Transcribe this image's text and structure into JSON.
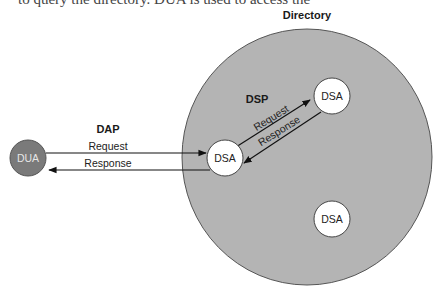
{
  "intro_text_fragment": "to query the directory. DUA is used to access the",
  "directory": {
    "title": "Directory",
    "fill_color": "#b4b4b4",
    "border_color": "#555555"
  },
  "nodes": {
    "dua": {
      "label": "DUA",
      "fill_color": "#7a7a7a"
    },
    "dsa_entry": {
      "label": "DSA",
      "fill_color": "#ffffff"
    },
    "dsa_upper": {
      "label": "DSA",
      "fill_color": "#ffffff"
    },
    "dsa_lower": {
      "label": "DSA",
      "fill_color": "#ffffff"
    }
  },
  "dap": {
    "protocol_label": "DAP",
    "request_label": "Request",
    "response_label": "Response"
  },
  "dsp": {
    "protocol_label": "DSP",
    "request_label": "Request",
    "response_label": "Response"
  }
}
